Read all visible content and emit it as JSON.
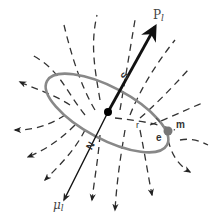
{
  "diagram": {
    "labels": {
      "angular_momentum": "P",
      "angular_momentum_sub": "l",
      "magnetic_moment": "μ",
      "magnetic_moment_sub": "l",
      "south_pole": "S",
      "north_pole": "N",
      "mass": "m",
      "charge": "e",
      "radius": "r"
    },
    "colors": {
      "orbit": "#888888",
      "field_lines": "#333333",
      "vectors": "#111111",
      "electron": "#777777",
      "nucleus": "#000000"
    }
  }
}
